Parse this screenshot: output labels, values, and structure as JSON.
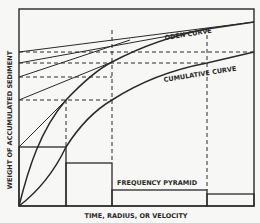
{
  "diagram": {
    "type": "sedimentation-analysis-schematic",
    "y_axis_label": "WEIGHT OF ACCUMULATED SEDIMENT",
    "x_axis_label": "TIME, RADIUS, OR VELOCITY",
    "curve_labels": {
      "oden": "ODÉN CURVE",
      "cumulative": "CUMULATIVE CURVE",
      "frequency": "FREQUENCY PYRAMID"
    },
    "colors": {
      "background": "#f7f7f5",
      "ink": "#2a2a2a"
    }
  }
}
